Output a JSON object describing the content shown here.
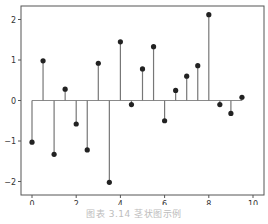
{
  "caption": "图表 3.14 茎状图示例",
  "colors": {
    "axes": "#555555",
    "stem": "#777777",
    "marker": "#222222",
    "baseline": "#8a8a8a"
  },
  "chart_data": {
    "type": "stem",
    "title": "",
    "xlabel": "",
    "ylabel": "",
    "xlim": [
      -0.5,
      10.5
    ],
    "ylim": [
      -2.3,
      2.35
    ],
    "xticks": [
      0,
      2,
      4,
      6,
      8,
      10
    ],
    "yticks": [
      -2,
      -1,
      0,
      1,
      2
    ],
    "grid": false,
    "legend": null,
    "baseline": 0,
    "x": [
      0.0,
      0.5,
      1.0,
      1.5,
      2.0,
      2.5,
      3.0,
      3.5,
      4.0,
      4.5,
      5.0,
      5.5,
      6.0,
      6.5,
      7.0,
      7.5,
      8.0,
      8.5,
      9.0,
      9.5,
      10.0
    ],
    "values": [
      -1.03,
      0.98,
      -1.33,
      0.28,
      -0.58,
      -1.22,
      0.92,
      -2.02,
      1.45,
      -0.1,
      0.78,
      1.33,
      -0.5,
      0.25,
      0.6,
      0.86,
      2.12,
      -0.1,
      -0.32,
      0.08,
      null
    ]
  }
}
